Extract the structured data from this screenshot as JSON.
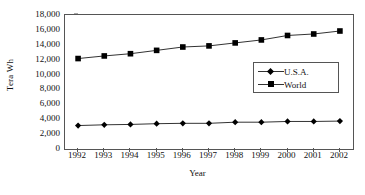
{
  "chart_data": {
    "type": "line",
    "title": "",
    "xlabel": "Year",
    "ylabel": "Tera Wh",
    "categories": [
      "1992",
      "1993",
      "1994",
      "1995",
      "1996",
      "1997",
      "1998",
      "1999",
      "2000",
      "2001",
      "2002"
    ],
    "x": [
      1992,
      1993,
      1994,
      1995,
      1996,
      1997,
      1998,
      1999,
      2000,
      2001,
      2002
    ],
    "series": [
      {
        "name": "U.S.A.",
        "marker": "diamond",
        "values": [
          3150,
          3250,
          3300,
          3400,
          3450,
          3450,
          3600,
          3600,
          3700,
          3700,
          3750
        ]
      },
      {
        "name": "World",
        "marker": "square",
        "values": [
          12150,
          12500,
          12800,
          13250,
          13700,
          13850,
          14250,
          14650,
          15250,
          15450,
          15850
        ]
      }
    ],
    "ylim": [
      0,
      18000
    ],
    "yticks": [
      0,
      2000,
      4000,
      6000,
      8000,
      10000,
      12000,
      14000,
      16000,
      18000
    ],
    "ytick_labels": [
      "0",
      "2,000",
      "4,000",
      "6,000",
      "8,000",
      "10,000",
      "12,000",
      "14,000",
      "16,000",
      "18,000"
    ],
    "grid": false,
    "legend_position": "center-right",
    "line_color": "#333333",
    "marker_color": "#000000",
    "axis_color": "#555555"
  },
  "legend": {
    "items": [
      {
        "label": "U.S.A."
      },
      {
        "label": "World"
      }
    ]
  }
}
